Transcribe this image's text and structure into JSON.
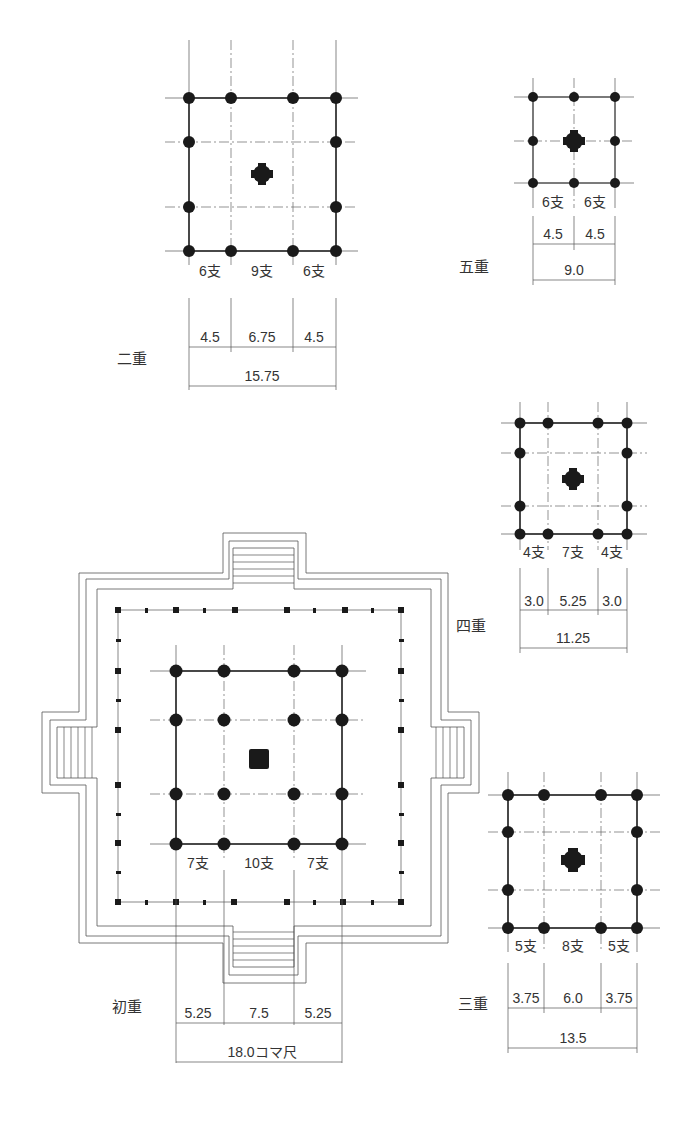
{
  "unit_label": "コマ尺",
  "stories": [
    {
      "id": "first",
      "label": "初重",
      "bays": [
        "7支",
        "10支",
        "7支"
      ],
      "dims": [
        "5.25",
        "7.5",
        "5.25"
      ],
      "total": "18.0コマ尺"
    },
    {
      "id": "second",
      "label": "二重",
      "bays": [
        "6支",
        "9支",
        "6支"
      ],
      "dims": [
        "4.5",
        "6.75",
        "4.5"
      ],
      "total": "15.75"
    },
    {
      "id": "third",
      "label": "三重",
      "bays": [
        "5支",
        "8支",
        "5支"
      ],
      "dims": [
        "3.75",
        "6.0",
        "3.75"
      ],
      "total": "13.5"
    },
    {
      "id": "fourth",
      "label": "四重",
      "bays": [
        "4支",
        "7支",
        "4支"
      ],
      "dims": [
        "3.0",
        "5.25",
        "3.0"
      ],
      "total": "11.25"
    },
    {
      "id": "fifth",
      "label": "五重",
      "bays": [
        "6支",
        "6支"
      ],
      "dims": [
        "4.5",
        "4.5"
      ],
      "total": "9.0"
    }
  ]
}
